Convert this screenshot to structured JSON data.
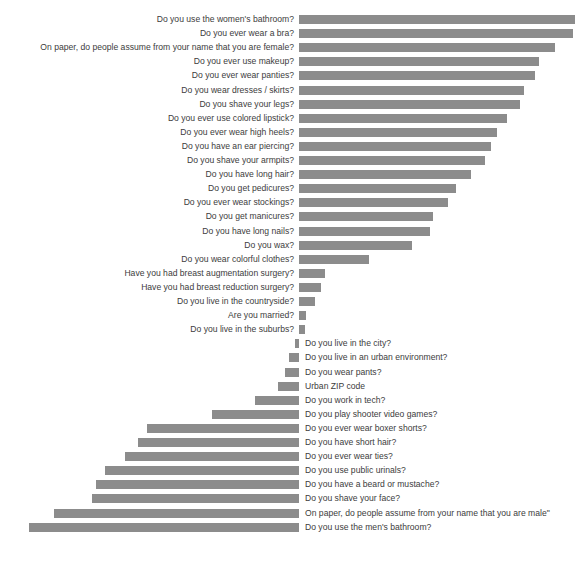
{
  "chart": {
    "title": "",
    "type": "bar",
    "orientation": "horizontal-diverging",
    "baseline_x_px": 299,
    "bar_color": "#8c8c8c",
    "text_color": "#3c3c3c",
    "background": "#ffffff",
    "grid": false,
    "legend": "none",
    "xlabel": "",
    "ylabel": ""
  },
  "chart_data": {
    "type": "bar",
    "title": "",
    "xlabel": "",
    "ylabel": "",
    "grid": false,
    "legend_position": "none",
    "orientation": "horizontal",
    "note": "Diverging horizontal bar chart. Positive values extend right from the zero baseline (female-associated questions, labels right-aligned at left of axis); negative values extend left from the baseline (male-associated questions, labels at right of axis). Values are bar lengths in pixels read off the image, zero baseline at x=299.",
    "xlim": [
      -270,
      276
    ],
    "categories": [
      "Do you use the women's bathroom?",
      "Do you ever wear a bra?",
      "On paper, do people assume from your name that you are female?",
      "Do you ever use makeup?",
      "Do you ever wear panties?",
      "Do you wear dresses / skirts?",
      "Do you shave your legs?",
      "Do you ever use colored lipstick?",
      "Do you ever wear high heels?",
      "Do you have an ear piercing?",
      "Do you shave your armpits?",
      "Do you have long hair?",
      "Do you get pedicures?",
      "Do you ever wear stockings?",
      "Do you get manicures?",
      "Do you have long nails?",
      "Do you wax?",
      "Do you wear colorful clothes?",
      "Have you had breast augmentation surgery?",
      "Have you had breast reduction surgery?",
      "Do you live in the countryside?",
      "Are you married?",
      "Do you live in the suburbs?",
      "Do you live in the city?",
      "Do you live in an urban environment?",
      "Do you wear pants?",
      "Urban ZIP code",
      "Do you work in tech?",
      "Do you play shooter video games?",
      "Do you ever wear boxer shorts?",
      "Do you have short hair?",
      "Do you ever wear ties?",
      "Do you use public urinals?",
      "Do you have a beard or mustache?",
      "Do you shave your face?",
      "On paper, do people assume from your name that you are male\"",
      "Do you use the men's bathroom?"
    ],
    "values": [
      276,
      274,
      256,
      240,
      236,
      225,
      221,
      208,
      198,
      192,
      186,
      172,
      157,
      149,
      134,
      131,
      113,
      70,
      26,
      22,
      16,
      7,
      6,
      -4,
      -10,
      -14,
      -21,
      -44,
      -87,
      -152,
      -161,
      -174,
      -194,
      -203,
      -207,
      -245,
      -270
    ],
    "rows": [
      {
        "label": "Do you use the women's bathroom?",
        "value": 276,
        "direction": "right"
      },
      {
        "label": "Do you ever wear a bra?",
        "value": 274,
        "direction": "right"
      },
      {
        "label": "On paper, do people assume from your name that you are female?",
        "value": 256,
        "direction": "right"
      },
      {
        "label": "Do you ever use makeup?",
        "value": 240,
        "direction": "right"
      },
      {
        "label": "Do you ever wear panties?",
        "value": 236,
        "direction": "right"
      },
      {
        "label": "Do you wear dresses / skirts?",
        "value": 225,
        "direction": "right"
      },
      {
        "label": "Do you shave your legs?",
        "value": 221,
        "direction": "right"
      },
      {
        "label": "Do you ever use colored lipstick?",
        "value": 208,
        "direction": "right"
      },
      {
        "label": "Do you ever wear high heels?",
        "value": 198,
        "direction": "right"
      },
      {
        "label": "Do you have an ear piercing?",
        "value": 192,
        "direction": "right"
      },
      {
        "label": "Do you shave your armpits?",
        "value": 186,
        "direction": "right"
      },
      {
        "label": "Do you have long hair?",
        "value": 172,
        "direction": "right"
      },
      {
        "label": "Do you get pedicures?",
        "value": 157,
        "direction": "right"
      },
      {
        "label": "Do you ever wear stockings?",
        "value": 149,
        "direction": "right"
      },
      {
        "label": "Do you get manicures?",
        "value": 134,
        "direction": "right"
      },
      {
        "label": "Do you have long nails?",
        "value": 131,
        "direction": "right"
      },
      {
        "label": "Do you wax?",
        "value": 113,
        "direction": "right"
      },
      {
        "label": "Do you wear colorful clothes?",
        "value": 70,
        "direction": "right"
      },
      {
        "label": "Have you had breast augmentation surgery?",
        "value": 26,
        "direction": "right"
      },
      {
        "label": "Have you had breast reduction surgery?",
        "value": 22,
        "direction": "right"
      },
      {
        "label": "Do you live in the countryside?",
        "value": 16,
        "direction": "right"
      },
      {
        "label": "Are you married?",
        "value": 7,
        "direction": "right"
      },
      {
        "label": "Do you live in the suburbs?",
        "value": 6,
        "direction": "right"
      },
      {
        "label": "Do you live in the city?",
        "value": -4,
        "direction": "left"
      },
      {
        "label": "Do you live in an urban environment?",
        "value": -10,
        "direction": "left"
      },
      {
        "label": "Do you wear pants?",
        "value": -14,
        "direction": "left"
      },
      {
        "label": "Urban ZIP code",
        "value": -21,
        "direction": "left"
      },
      {
        "label": "Do you work in tech?",
        "value": -44,
        "direction": "left"
      },
      {
        "label": "Do you play shooter video games?",
        "value": -87,
        "direction": "left"
      },
      {
        "label": "Do you ever wear boxer shorts?",
        "value": -152,
        "direction": "left"
      },
      {
        "label": "Do you have short hair?",
        "value": -161,
        "direction": "left"
      },
      {
        "label": "Do you ever wear ties?",
        "value": -174,
        "direction": "left"
      },
      {
        "label": "Do you use public urinals?",
        "value": -194,
        "direction": "left"
      },
      {
        "label": "Do you have a beard or mustache?",
        "value": -203,
        "direction": "left"
      },
      {
        "label": "Do you shave your face?",
        "value": -207,
        "direction": "left"
      },
      {
        "label": "On paper, do people assume from your name that you are male\"",
        "value": -245,
        "direction": "left"
      },
      {
        "label": "Do you use the men's bathroom?",
        "value": -270,
        "direction": "left"
      }
    ]
  }
}
